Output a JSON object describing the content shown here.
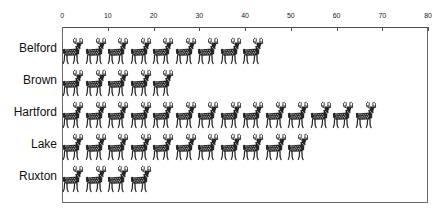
{
  "chart_data": {
    "type": "bar",
    "subtype": "pictograph",
    "title": "",
    "xlabel": "",
    "ylabel": "",
    "orientation": "horizontal",
    "categories": [
      "Belford",
      "Brown",
      "Hartford",
      "Lake",
      "Ruxton"
    ],
    "values": [
      45,
      25,
      70,
      55,
      20
    ],
    "icon_counts": [
      9,
      5,
      14,
      11,
      4
    ],
    "icon": "deer-icon",
    "icon_unit_value": 5,
    "xlim": [
      0,
      80
    ],
    "xticks": [
      0,
      10,
      20,
      30,
      40,
      50,
      60,
      70,
      80
    ],
    "xtick_labels": [
      "0",
      "10",
      "20",
      "30",
      "40",
      "50",
      "60",
      "70",
      "80"
    ],
    "grid": false,
    "legend": false,
    "axis_position": "top",
    "colors": {
      "icon": "#262626",
      "frame": "#6b6b6b",
      "axis": "#4d4d4d",
      "text": "#111111",
      "background": "#ffffff"
    }
  },
  "rows": [
    {
      "label": "Belford",
      "count": 9,
      "value": 45
    },
    {
      "label": "Brown",
      "count": 5,
      "value": 25
    },
    {
      "label": "Hartford",
      "count": 14,
      "value": 70
    },
    {
      "label": "Lake",
      "count": 11,
      "value": 55
    },
    {
      "label": "Ruxton",
      "count": 4,
      "value": 20
    }
  ],
  "axis": {
    "ticks": [
      "0",
      "10",
      "20",
      "30",
      "40",
      "50",
      "60",
      "70",
      "80"
    ]
  }
}
